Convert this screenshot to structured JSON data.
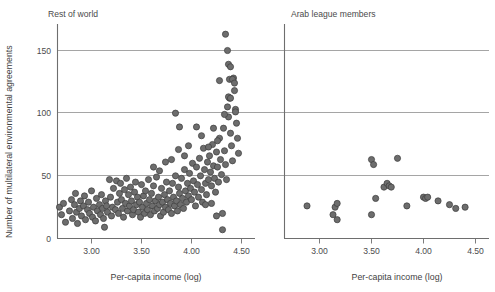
{
  "chart_data": {
    "type": "scatter",
    "title": "",
    "xlabel": "Per-capita income (log)",
    "ylabel": "Number of multilateral environmental agreements",
    "xlim": [
      2.62,
      4.62
    ],
    "ylim": [
      0,
      168
    ],
    "grid": true,
    "gridlines_y": [
      50,
      100,
      150
    ],
    "legend": "none",
    "yticks": [
      0,
      50,
      100,
      150
    ],
    "ytick_labels": [
      "0",
      "50",
      "100",
      "150"
    ],
    "xticks": [
      3.0,
      3.5,
      4.0,
      4.5
    ],
    "xtick_labels": [
      "3.00",
      "3.50",
      "4.00",
      "4.50"
    ],
    "panels": [
      {
        "name": "rest-of-world",
        "label": "Rest of world",
        "xlabel": "Per-capita income (log)",
        "n_points": 181,
        "points": [
          [
            2.68,
            25
          ],
          [
            2.7,
            19
          ],
          [
            2.72,
            28
          ],
          [
            2.74,
            13
          ],
          [
            2.78,
            22
          ],
          [
            2.8,
            31
          ],
          [
            2.81,
            16
          ],
          [
            2.83,
            27
          ],
          [
            2.84,
            36
          ],
          [
            2.85,
            21
          ],
          [
            2.86,
            12
          ],
          [
            2.88,
            24
          ],
          [
            2.89,
            30
          ],
          [
            2.9,
            18
          ],
          [
            2.92,
            26
          ],
          [
            2.93,
            34
          ],
          [
            2.94,
            15
          ],
          [
            2.96,
            23
          ],
          [
            2.97,
            29
          ],
          [
            2.98,
            20
          ],
          [
            3.0,
            38
          ],
          [
            3.01,
            17
          ],
          [
            3.02,
            25
          ],
          [
            3.04,
            14
          ],
          [
            3.05,
            32
          ],
          [
            3.06,
            22
          ],
          [
            3.08,
            27
          ],
          [
            3.09,
            19
          ],
          [
            3.1,
            35
          ],
          [
            3.11,
            24
          ],
          [
            3.12,
            16
          ],
          [
            3.13,
            9
          ],
          [
            3.14,
            30
          ],
          [
            3.15,
            26
          ],
          [
            3.16,
            21
          ],
          [
            3.18,
            47
          ],
          [
            3.19,
            33
          ],
          [
            3.2,
            18
          ],
          [
            3.21,
            25
          ],
          [
            3.22,
            40
          ],
          [
            3.24,
            23
          ],
          [
            3.25,
            46
          ],
          [
            3.26,
            29
          ],
          [
            3.27,
            20
          ],
          [
            3.28,
            36
          ],
          [
            3.29,
            44
          ],
          [
            3.3,
            31
          ],
          [
            3.31,
            24
          ],
          [
            3.32,
            17
          ],
          [
            3.33,
            39
          ],
          [
            3.34,
            28
          ],
          [
            3.35,
            48
          ],
          [
            3.36,
            22
          ],
          [
            3.37,
            35
          ],
          [
            3.38,
            26
          ],
          [
            3.39,
            41
          ],
          [
            3.4,
            30
          ],
          [
            3.41,
            19
          ],
          [
            3.42,
            23
          ],
          [
            3.43,
            37
          ],
          [
            3.44,
            45
          ],
          [
            3.45,
            27
          ],
          [
            3.46,
            33
          ],
          [
            3.47,
            21
          ],
          [
            3.48,
            29
          ],
          [
            3.49,
            17
          ],
          [
            3.5,
            43
          ],
          [
            3.51,
            25
          ],
          [
            3.52,
            34
          ],
          [
            3.53,
            20
          ],
          [
            3.54,
            38
          ],
          [
            3.55,
            28
          ],
          [
            3.56,
            23
          ],
          [
            3.57,
            47
          ],
          [
            3.58,
            31
          ],
          [
            3.59,
            19
          ],
          [
            3.6,
            36
          ],
          [
            3.61,
            26
          ],
          [
            3.62,
            42
          ],
          [
            3.63,
            22
          ],
          [
            3.64,
            30
          ],
          [
            3.65,
            49
          ],
          [
            3.66,
            24
          ],
          [
            3.67,
            33
          ],
          [
            3.68,
            27
          ],
          [
            3.69,
            18
          ],
          [
            3.7,
            40
          ],
          [
            3.71,
            29
          ],
          [
            3.72,
            21
          ],
          [
            3.73,
            35
          ],
          [
            3.74,
            25
          ],
          [
            3.75,
            45
          ],
          [
            3.76,
            31
          ],
          [
            3.77,
            23
          ],
          [
            3.78,
            38
          ],
          [
            3.79,
            28
          ],
          [
            3.8,
            20
          ],
          [
            3.81,
            44
          ],
          [
            3.82,
            33
          ],
          [
            3.83,
            26
          ],
          [
            3.84,
            50
          ],
          [
            3.85,
            30
          ],
          [
            3.86,
            22
          ],
          [
            3.87,
            41
          ],
          [
            3.88,
            36
          ],
          [
            3.89,
            27
          ],
          [
            3.9,
            48
          ],
          [
            3.91,
            32
          ],
          [
            3.92,
            24
          ],
          [
            3.93,
            55
          ],
          [
            3.94,
            38
          ],
          [
            3.95,
            29
          ],
          [
            3.96,
            44
          ],
          [
            3.97,
            34
          ],
          [
            3.98,
            52
          ],
          [
            3.99,
            40
          ],
          [
            4.0,
            31
          ],
          [
            4.01,
            60
          ],
          [
            4.02,
            46
          ],
          [
            4.03,
            37
          ],
          [
            4.04,
            26
          ],
          [
            4.05,
            57
          ],
          [
            4.06,
            43
          ],
          [
            4.07,
            33
          ],
          [
            4.08,
            64
          ],
          [
            4.09,
            50
          ],
          [
            4.1,
            39
          ],
          [
            4.11,
            29
          ],
          [
            4.12,
            72
          ],
          [
            4.13,
            55
          ],
          [
            4.14,
            44
          ],
          [
            4.15,
            35
          ],
          [
            4.16,
            61
          ],
          [
            4.17,
            47
          ],
          [
            4.18,
            66
          ],
          [
            4.19,
            53
          ],
          [
            4.2,
            42
          ],
          [
            4.21,
            75
          ],
          [
            4.22,
            58
          ],
          [
            4.23,
            48
          ],
          [
            4.24,
            37
          ],
          [
            4.25,
            69
          ],
          [
            4.26,
            57
          ],
          [
            4.27,
            45
          ],
          [
            4.28,
            80
          ],
          [
            4.29,
            63
          ],
          [
            4.3,
            51
          ],
          [
            4.31,
            20
          ],
          [
            4.32,
            88
          ],
          [
            4.33,
            70
          ],
          [
            4.34,
            59
          ],
          [
            4.35,
            47
          ],
          [
            4.36,
            105
          ],
          [
            4.37,
            97
          ],
          [
            4.38,
            112
          ],
          [
            4.39,
            84
          ],
          [
            4.4,
            74
          ],
          [
            4.41,
            62
          ],
          [
            4.42,
            128
          ],
          [
            4.43,
            118
          ],
          [
            4.44,
            103
          ],
          [
            4.45,
            92
          ],
          [
            4.46,
            80
          ],
          [
            4.47,
            68
          ],
          [
            4.34,
            163
          ],
          [
            4.36,
            150
          ],
          [
            4.37,
            139
          ],
          [
            4.39,
            137
          ],
          [
            4.38,
            127
          ],
          [
            4.41,
            127
          ],
          [
            4.43,
            124
          ],
          [
            4.28,
            126
          ],
          [
            4.37,
            113
          ],
          [
            4.39,
            112
          ],
          [
            4.44,
            101
          ],
          [
            4.33,
            99
          ],
          [
            3.84,
            100
          ],
          [
            3.88,
            89
          ],
          [
            4.05,
            89
          ],
          [
            4.22,
            88
          ],
          [
            4.1,
            82
          ],
          [
            4.26,
            78
          ],
          [
            3.97,
            74
          ],
          [
            4.17,
            73
          ],
          [
            4.31,
            7
          ],
          [
            4.2,
            28
          ],
          [
            4.25,
            18
          ],
          [
            4.14,
            27
          ],
          [
            3.62,
            57
          ],
          [
            3.74,
            61
          ],
          [
            3.8,
            63
          ],
          [
            3.93,
            66
          ],
          [
            3.87,
            71
          ],
          [
            3.68,
            54
          ]
        ]
      },
      {
        "name": "arab-league-members",
        "label": "Arab league members",
        "xlabel": "Per-capita income (log)",
        "n_points": 22,
        "points": [
          [
            2.88,
            26
          ],
          [
            3.13,
            19
          ],
          [
            3.17,
            15
          ],
          [
            3.15,
            25
          ],
          [
            3.17,
            28
          ],
          [
            3.5,
            63
          ],
          [
            3.52,
            59
          ],
          [
            3.75,
            64
          ],
          [
            3.5,
            19
          ],
          [
            3.54,
            32
          ],
          [
            3.62,
            41
          ],
          [
            3.65,
            44
          ],
          [
            3.67,
            42
          ],
          [
            3.69,
            41
          ],
          [
            3.84,
            26
          ],
          [
            4.0,
            33
          ],
          [
            4.02,
            32
          ],
          [
            4.04,
            33
          ],
          [
            4.14,
            30
          ],
          [
            4.25,
            27
          ],
          [
            4.31,
            24
          ],
          [
            4.4,
            25
          ]
        ]
      }
    ]
  },
  "axis": {
    "y_label": "Number of multilateral environmental agreements",
    "x_label_left": "Per-capita income (log)",
    "x_label_right": "Per-capita income (log)"
  },
  "colors": {
    "dot_fill": "#6d6d6d",
    "dot_stroke": "#3c3c3c",
    "gridline": "#8e8e8e",
    "axis": "#6e6e6e",
    "text": "#4b4b4b",
    "background": "#ffffff"
  }
}
